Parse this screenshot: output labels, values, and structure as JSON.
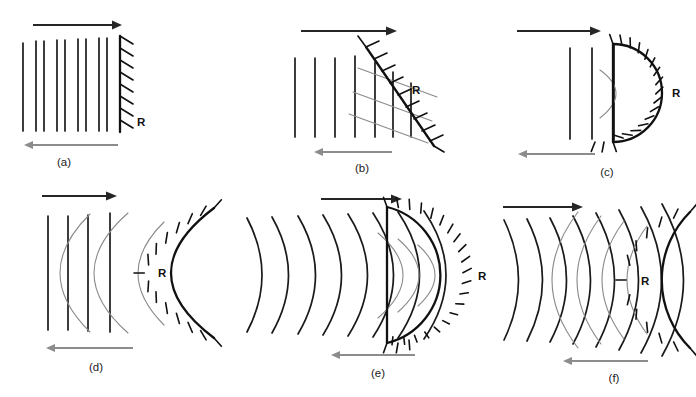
{
  "figure": {
    "background_color": "#ffffff",
    "width": 696,
    "height": 397,
    "incident_arrow_color": "#262626",
    "reflected_arrow_color": "#8c8c8c",
    "incident_wavefront_color": "#1a1a1a",
    "reflected_wavefront_color": "#8a8a8a",
    "reflector_color": "#111111"
  },
  "common": {
    "reflector_label": "R"
  },
  "panels": [
    {
      "id": "a",
      "caption": "(a)",
      "reflector_label": "R",
      "reflector_type": "plane-vertical",
      "incident_wave_type": "plane",
      "incident_wavefront_count": 7,
      "reflected_wavefront_count": 0,
      "incident_direction": "right",
      "reflected_direction": "left"
    },
    {
      "id": "b",
      "caption": "(b)",
      "reflector_label": "R",
      "reflector_type": "plane-inclined",
      "incident_wave_type": "plane",
      "incident_wavefront_count": 7,
      "reflected_wavefront_count": 3,
      "incident_direction": "right",
      "reflected_direction": "left"
    },
    {
      "id": "c",
      "caption": "(c)",
      "reflector_label": "R",
      "reflector_type": "concave-semicircle",
      "incident_wave_type": "plane",
      "incident_wavefront_count": 3,
      "reflected_wavefront_count": 1,
      "incident_direction": "right",
      "reflected_direction": "left"
    },
    {
      "id": "d",
      "caption": "(d)",
      "reflector_label": "R",
      "reflector_type": "concave-parabolic",
      "incident_wave_type": "plane",
      "incident_wavefront_count": 4,
      "reflected_wavefront_count": 3,
      "incident_direction": "right",
      "reflected_direction": "left"
    },
    {
      "id": "e",
      "caption": "(e)",
      "reflector_label": "R",
      "reflector_type": "concave-semicircle",
      "incident_wave_type": "circular-diverging",
      "incident_wavefront_count": 8,
      "reflected_wavefront_count": 3,
      "incident_direction": "right",
      "reflected_direction": "left"
    },
    {
      "id": "f",
      "caption": "(f)",
      "reflector_label": "R",
      "reflector_type": "concave-large-radius",
      "incident_wave_type": "circular-diverging",
      "incident_wavefront_count": 8,
      "reflected_wavefront_count": 4,
      "incident_direction": "right",
      "reflected_direction": "left"
    }
  ]
}
